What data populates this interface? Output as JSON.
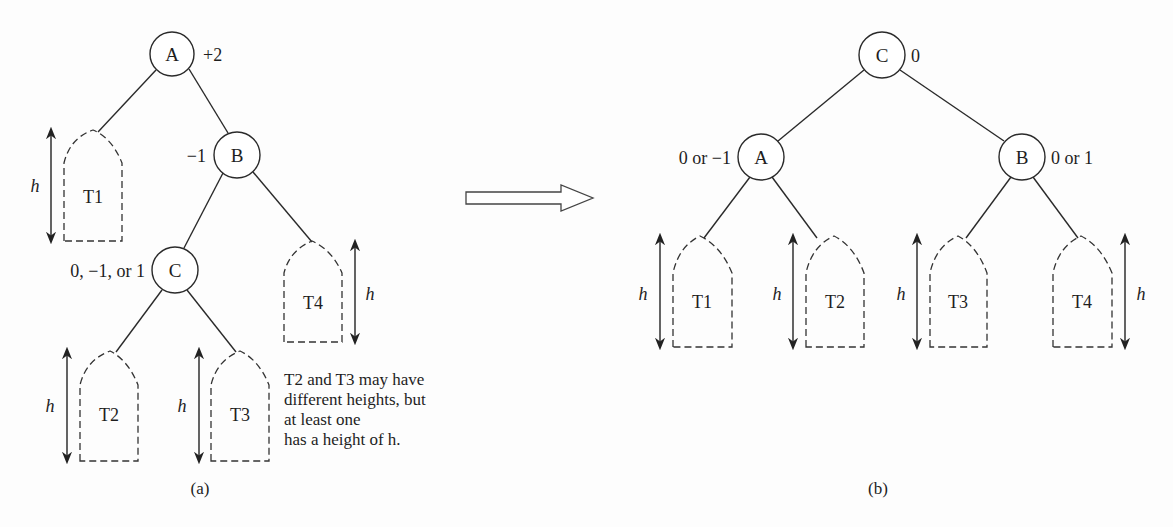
{
  "figure": {
    "panel_a": {
      "caption": "(a)",
      "nodes": [
        {
          "id": "A",
          "label": "A",
          "balance": "+2",
          "cx": 172,
          "cy": 54
        },
        {
          "id": "B",
          "label": "B",
          "balance": "−1",
          "cx": 237,
          "cy": 155
        },
        {
          "id": "C",
          "label": "C",
          "balance": "0, −1, or 1",
          "cx": 175,
          "cy": 270
        }
      ],
      "subtrees": [
        {
          "label": "T1",
          "height_label": "h",
          "x": 64,
          "peak": 130,
          "bottom": 241,
          "arrow_side": "left"
        },
        {
          "label": "T2",
          "height_label": "h",
          "x": 80,
          "peak": 350,
          "bottom": 461,
          "arrow_side": "left"
        },
        {
          "label": "T3",
          "height_label": "h",
          "x": 211,
          "peak": 350,
          "bottom": 461,
          "arrow_side": "left"
        },
        {
          "label": "T4",
          "height_label": "h",
          "x": 284,
          "peak": 240,
          "bottom": 342,
          "arrow_side": "right"
        }
      ],
      "note": [
        "T2 and T3 may have",
        "different heights, but",
        "at least one",
        "has a height of h."
      ]
    },
    "transform_arrow": {
      "direction": "right"
    },
    "panel_b": {
      "caption": "(b)",
      "nodes": [
        {
          "id": "C",
          "label": "C",
          "balance": "0",
          "cx": 882,
          "cy": 55
        },
        {
          "id": "A",
          "label": "A",
          "balance": "0 or −1",
          "cx": 761,
          "cy": 157
        },
        {
          "id": "B",
          "label": "B",
          "balance": "0 or 1",
          "cx": 1022,
          "cy": 157
        }
      ],
      "subtrees": [
        {
          "label": "T1",
          "height_label": "h",
          "x": 673,
          "peak": 236,
          "bottom": 347,
          "arrow_side": "left"
        },
        {
          "label": "T2",
          "height_label": "h",
          "x": 806,
          "peak": 236,
          "bottom": 347,
          "arrow_side": "left"
        },
        {
          "label": "T3",
          "height_label": "h",
          "x": 930,
          "peak": 236,
          "bottom": 347,
          "arrow_side": "left"
        },
        {
          "label": "T4",
          "height_label": "h",
          "x": 1053,
          "peak": 236,
          "bottom": 347,
          "arrow_side": "right"
        }
      ]
    }
  }
}
